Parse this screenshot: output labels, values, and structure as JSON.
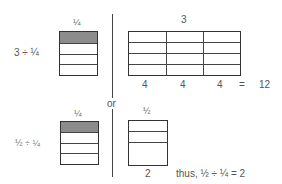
{
  "diagram": {
    "top": {
      "expression": "3 ÷ ¼",
      "fraction_box_label": "¼",
      "fraction_box": {
        "parts": 4,
        "shaded": 1
      },
      "whole_grid_label": "3",
      "whole_grid": {
        "columns": 3,
        "rows": 4
      },
      "column_counts": [
        "4",
        "4",
        "4"
      ],
      "equals": "=",
      "result": "12"
    },
    "separator_label": "or",
    "bottom": {
      "expression": "½ ÷ ¼",
      "fraction_box_label": "¼",
      "fraction_box": {
        "parts": 4,
        "shaded": 1
      },
      "half_box_label": "½",
      "half_box": {
        "rows_split": 2,
        "lower_half_undivided": true
      },
      "count": "2",
      "conclusion": "thus, ½ ÷ ¼ = 2"
    }
  },
  "colors": {
    "line": "#333333",
    "shade": "#8c8c8c",
    "text": "#555555"
  }
}
